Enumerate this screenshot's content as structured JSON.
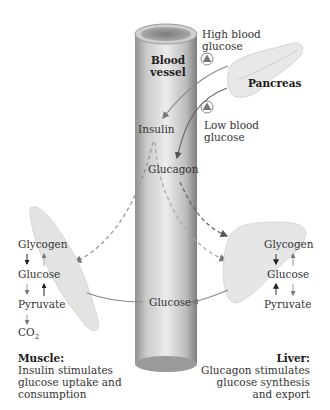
{
  "vessel": {
    "title_line1": "Blood",
    "title_line2": "vessel"
  },
  "pancreas": {
    "label": "Pancreas"
  },
  "signals": {
    "high_glucose_line1": "High blood",
    "high_glucose_line2": "glucose",
    "low_glucose_line1": "Low blood",
    "low_glucose_line2": "glucose",
    "insulin": "Insulin",
    "glucagon": "Glucagon",
    "glucose": "Glucose"
  },
  "muscle": {
    "pathway": [
      "Glycogen",
      "Glucose",
      "Pyruvate",
      "CO",
      "2"
    ],
    "title": "Muscle:",
    "desc_line1": "Insulin stimulates",
    "desc_line2": "glucose uptake and",
    "desc_line3": "consumption"
  },
  "liver": {
    "pathway": [
      "Glycogen",
      "Glucose",
      "Pyruvate"
    ],
    "title": "Liver:",
    "desc_line1": "Glucagon stimulates",
    "desc_line2": "glucose synthesis",
    "desc_line3": "and export"
  },
  "colors": {
    "vessel_dark": "#8a8a8a",
    "vessel_light": "#e6e6e6",
    "organ_fill": "#e4e4e4",
    "arrow": "#777777",
    "dashed_arrow": "#8a8a8a",
    "text": "#2a2a2a"
  }
}
